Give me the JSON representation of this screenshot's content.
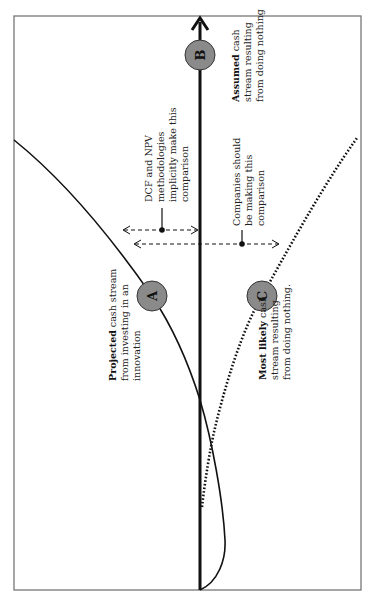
{
  "diagram": {
    "orientation": "rotated-90-ccw",
    "colors": {
      "frame": "#777777",
      "line": "#111111",
      "circle_fill": "#8a8a8a",
      "circle_stroke": "#333333",
      "text": "#222222"
    },
    "markers": [
      {
        "id": "A",
        "label": "A"
      },
      {
        "id": "B",
        "label": "B"
      },
      {
        "id": "C",
        "label": "C"
      }
    ],
    "labels": {
      "projected": {
        "bold": "Projected",
        "rest_line1": " cash stream",
        "line2": "from investing in an",
        "line3": "innovation"
      },
      "assumed": {
        "bold": "Assumed",
        "rest_line1": " cash",
        "line2": "stream resulting",
        "line3": "from doing nothing"
      },
      "most_likely": {
        "bold": "Most likely",
        "rest_line1": " cash",
        "line2": "stream resulting",
        "line3": "from doing nothing."
      },
      "dcf_npv": {
        "line1": "DCF and NPV",
        "line2": "methodologies",
        "line3": "implicitly make this",
        "line4": "comparison"
      },
      "companies_should": {
        "line1": "Companies should",
        "line2": "be making this",
        "line3": "comparison"
      }
    }
  }
}
